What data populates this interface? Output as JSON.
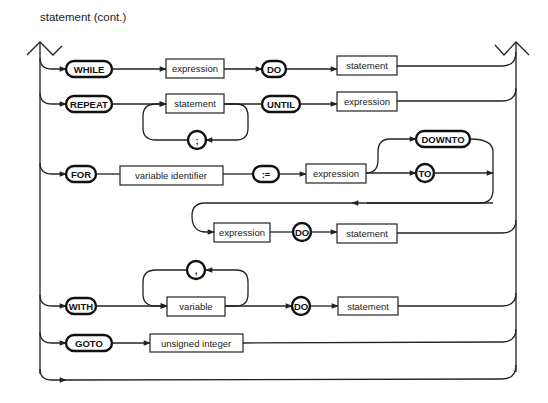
{
  "title": "statement (cont.)",
  "diagram": {
    "type": "syntax-diagram",
    "rows": {
      "while": {
        "keyword": "WHILE",
        "expr": "expression",
        "do": "DO",
        "stmt": "statement"
      },
      "repeat": {
        "keyword": "REPEAT",
        "stmt": "statement",
        "sep": ";",
        "until": "UNTIL",
        "expr": "expression"
      },
      "for": {
        "keyword": "FOR",
        "var": "variable identifier",
        "assign": ":=",
        "expr1": "expression",
        "downto": "DOWNTO",
        "to": "TO",
        "expr2": "expression",
        "do": "DO",
        "stmt": "statement"
      },
      "with": {
        "keyword": "WITH",
        "var": "variable",
        "sep": ",",
        "do": "DO",
        "stmt": "statement"
      },
      "goto": {
        "keyword": "GOTO",
        "label": "unsigned integer"
      }
    }
  }
}
